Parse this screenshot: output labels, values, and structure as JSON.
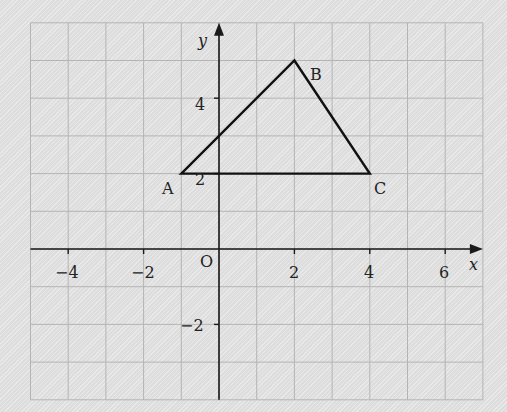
{
  "diagram": {
    "type": "coordinate-grid",
    "grid": {
      "x_min": -5,
      "x_max": 7,
      "y_min": -4,
      "y_max": 6,
      "step": 1
    },
    "axes": {
      "x_label": "x",
      "y_label": "y",
      "origin_label": "O",
      "x_ticks": [
        {
          "value": -4,
          "label": "−4"
        },
        {
          "value": -2,
          "label": "−2"
        },
        {
          "value": 2,
          "label": "2"
        },
        {
          "value": 4,
          "label": "4"
        },
        {
          "value": 6,
          "label": "6"
        }
      ],
      "y_ticks": [
        {
          "value": 4,
          "label": "4"
        },
        {
          "value": 2,
          "label": "2"
        },
        {
          "value": -2,
          "label": "−2"
        }
      ]
    },
    "triangle": {
      "vertices": [
        {
          "name": "A",
          "x": -1,
          "y": 2
        },
        {
          "name": "B",
          "x": 2,
          "y": 5
        },
        {
          "name": "C",
          "x": 4,
          "y": 2
        }
      ]
    },
    "colors": {
      "grid": "#b4b4b4",
      "axes": "#1a1a1a",
      "shape": "#111111",
      "background": "#e4e4e4"
    }
  }
}
